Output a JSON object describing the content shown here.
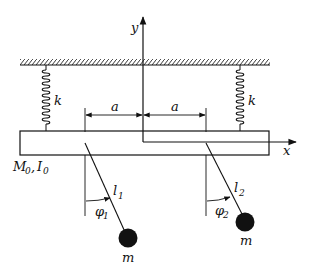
{
  "diagram": {
    "type": "mechanical-system",
    "labels": {
      "y_axis": "y",
      "x_axis": "x",
      "spring_left": "k",
      "spring_right": "k",
      "dim_left": "a",
      "dim_right": "a",
      "block": "M",
      "block_sub": "0",
      "inertia": "I",
      "inertia_sub": "0",
      "block_sep": ",",
      "pend1_length": "l",
      "pend1_length_sub": "1",
      "pend2_length": "l",
      "pend2_length_sub": "2",
      "pend1_angle": "φ",
      "pend1_angle_sub": "1",
      "pend2_angle": "φ",
      "pend2_angle_sub": "2",
      "mass1": "m",
      "mass2": "m"
    },
    "colors": {
      "ink": "#111111",
      "background": "#ffffff"
    }
  }
}
